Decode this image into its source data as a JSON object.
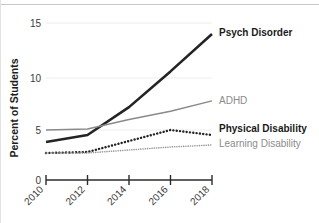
{
  "chart_data": {
    "type": "line",
    "title": "",
    "xlabel": "",
    "ylabel": "Percent of Students",
    "x": [
      2010,
      2012,
      2014,
      2016,
      2018
    ],
    "xtick_labels": [
      "2010",
      "2012",
      "2014",
      "2016",
      "2018"
    ],
    "ytick_labels": [
      "0",
      "5",
      "10",
      "15"
    ],
    "yticks": [
      0,
      5,
      10,
      15
    ],
    "ylim": [
      0,
      15.8
    ],
    "xlim": [
      2010,
      2018
    ],
    "grid": "horizontal-faint",
    "legend": "inline-right-of-line-ends",
    "series": [
      {
        "name": "Psych Disorder",
        "values": [
          3.8,
          4.5,
          7.2,
          10.6,
          14.0
        ],
        "color": "#242424",
        "style": "solid",
        "width": 2.6,
        "label_weight": "bold"
      },
      {
        "name": "ADHD",
        "values": [
          5.0,
          5.1,
          6.0,
          6.8,
          7.8
        ],
        "color": "#8a8a8a",
        "style": "solid",
        "width": 1.5,
        "label_weight": "normal"
      },
      {
        "name": "Physical Disability",
        "values": [
          2.7,
          2.8,
          3.9,
          5.0,
          4.5
        ],
        "color": "#242424",
        "style": "dotted",
        "width": 2.4,
        "label_weight": "bold"
      },
      {
        "name": "Learning Disability",
        "values": [
          2.7,
          2.7,
          3.0,
          3.3,
          3.5
        ],
        "color": "#9a9a9a",
        "style": "dotted",
        "width": 1.6,
        "label_weight": "normal"
      }
    ]
  },
  "axis": {
    "y_title": "Percent of Students",
    "zero_label": "0"
  },
  "labels": {
    "psych": "Psych Disorder",
    "adhd": "ADHD",
    "physical": "Physical Disability",
    "learning": "Learning Disability"
  },
  "colors": {
    "ink": "#242424",
    "muted": "#8a8a8a",
    "muted_light": "#9a9a9a",
    "grid": "#ededed",
    "border": "#c9c9c9"
  }
}
